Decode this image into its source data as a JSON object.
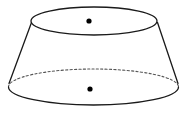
{
  "figure": {
    "title": "Conical frustum (truncated cone) geometric diagram",
    "shape_name": "frustum",
    "canvas": {
      "width": 186,
      "height": 115,
      "background": "#ffffff"
    },
    "colors": {
      "stroke": "#1a1a1a",
      "hidden_stroke": "#555555",
      "dot": "#000000",
      "fill": "none",
      "background": "#ffffff"
    },
    "stroke_width": 1.3,
    "hidden_stroke_width": 1.1,
    "hidden_dash_pattern": "2.2 2.2",
    "top_face": {
      "name": "top-circle",
      "center_x": 94,
      "center_y": 21,
      "radius_x": 63,
      "radius_y": 14,
      "style": "solid",
      "visible_back_arc": true
    },
    "bottom_face": {
      "name": "bottom-circle",
      "center_x": 93.5,
      "center_y": 87,
      "radius_x": 85,
      "radius_y": 18,
      "front_arc_style": "solid",
      "back_arc_style": "dashed"
    },
    "left_side": {
      "name": "left-slant-edge",
      "x1": 31.5,
      "y1": 22.5,
      "x2": 9.0,
      "y2": 83.5
    },
    "right_side": {
      "name": "right-slant-edge",
      "x1": 157.5,
      "y1": 22.5,
      "x2": 178.0,
      "y2": 83.5
    },
    "center_dots": [
      {
        "label": "top-face-center-dot",
        "x": 89,
        "y": 21,
        "radius": 2.6
      },
      {
        "label": "bottom-face-center-dot",
        "x": 90,
        "y": 89,
        "radius": 2.6
      }
    ]
  }
}
